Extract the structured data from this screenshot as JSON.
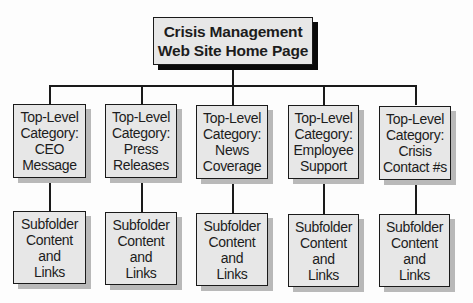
{
  "diagram": {
    "type": "hierarchy",
    "root": {
      "label": "Crisis Management\nWeb Site Home Page"
    },
    "categories": [
      {
        "label": "Top-Level\nCategory:\nCEO\nMessage",
        "child": "Subfolder\nContent\nand\nLinks"
      },
      {
        "label": "Top-Level\nCategory:\nPress\nReleases",
        "child": "Subfolder\nContent\nand\nLinks"
      },
      {
        "label": "Top-Level\nCategory:\nNews\nCoverage",
        "child": "Subfolder\nContent\nand\nLinks"
      },
      {
        "label": "Top-Level\nCategory:\nEmployee\nSupport",
        "child": "Subfolder\nContent\nand\nLinks"
      },
      {
        "label": "Top-Level\nCategory:\nCrisis\nContact #s",
        "child": "Subfolder\nContent\nand\nLinks"
      }
    ],
    "colors": {
      "box_fill": "#e7e7e7",
      "border": "#1a1a1a",
      "root_shadow": "#0a0a0a",
      "child_shadow": "#b9b9b9"
    }
  }
}
